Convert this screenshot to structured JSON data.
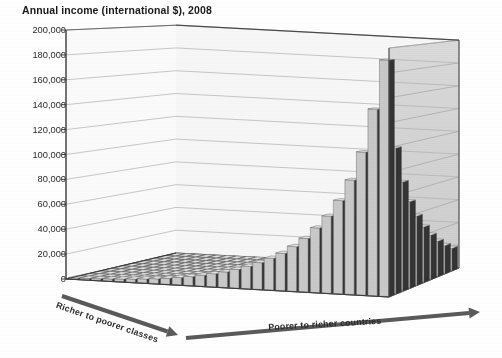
{
  "chart_data": {
    "type": "bar",
    "title": "Annual income (international $), 2008",
    "subtitle": "",
    "xlabel": "Poorer to richer countries",
    "ylabel": "Richer to poorer classes",
    "zlabel": "Annual income (international $)",
    "projection": "3d-surface-bars",
    "grid": true,
    "legend_position": "none",
    "zlim": [
      0,
      200000
    ],
    "ztick_labels": [
      "200,000",
      "180,000",
      "160,000",
      "140,000",
      "120,000",
      "100,000",
      "80,000",
      "60,000",
      "40,000",
      "20,000",
      "0"
    ],
    "ztick_values": [
      200000,
      180000,
      160000,
      140000,
      120000,
      100000,
      80000,
      60000,
      40000,
      20000,
      0
    ],
    "ztick_interval": 20000,
    "annotations": [
      {
        "text": "Richer to poorer classes",
        "kind": "axis-arrow",
        "direction": "right-down"
      },
      {
        "text": "Poorer to richer countries",
        "kind": "axis-arrow",
        "direction": "right"
      }
    ],
    "row_axis": "income class (decile), richer to poorer",
    "col_axis": "country, poorer to richer",
    "categories_rows": [
      "class 1 (richest)",
      "class 2",
      "class 3",
      "class 4",
      "class 5",
      "class 6",
      "class 7",
      "class 8",
      "class 9",
      "class 10 (poorest)"
    ],
    "categories_cols": [
      "c01",
      "c02",
      "c03",
      "c04",
      "c05",
      "c06",
      "c07",
      "c08",
      "c09",
      "c10",
      "c11",
      "c12",
      "c13",
      "c14",
      "c15",
      "c16",
      "c17",
      "c18",
      "c19",
      "c20",
      "c21",
      "c22",
      "c23",
      "c24",
      "c25",
      "c26",
      "c27",
      "c28"
    ],
    "series": [
      {
        "name": "class 1 (richest)",
        "values": [
          900,
          1100,
          1400,
          1700,
          2100,
          2600,
          3200,
          3900,
          4800,
          5900,
          7200,
          8800,
          10500,
          12500,
          15000,
          18000,
          21500,
          25500,
          30000,
          36000,
          43000,
          52000,
          62000,
          75000,
          92000,
          115000,
          150000,
          190000
        ]
      },
      {
        "name": "class 2",
        "values": [
          600,
          740,
          930,
          1150,
          1400,
          1750,
          2150,
          2600,
          3200,
          3950,
          4800,
          5900,
          7000,
          8400,
          10000,
          12000,
          14300,
          17000,
          20000,
          24000,
          28500,
          34500,
          41000,
          49500,
          60000,
          75000,
          95000,
          118000
        ]
      },
      {
        "name": "class 3",
        "values": [
          450,
          560,
          700,
          860,
          1060,
          1320,
          1620,
          1960,
          2420,
          2980,
          3620,
          4450,
          5280,
          6330,
          7540,
          9050,
          10780,
          12800,
          15080,
          18100,
          21500,
          26000,
          30900,
          37300,
          45200,
          56500,
          71600,
          88900
        ]
      },
      {
        "name": "class 4",
        "values": [
          360,
          445,
          560,
          690,
          850,
          1050,
          1300,
          1570,
          1940,
          2390,
          2900,
          3560,
          4230,
          5070,
          6030,
          7240,
          8620,
          10250,
          12060,
          14480,
          17200,
          20800,
          24700,
          29850,
          36150,
          45200,
          57300,
          71100
        ]
      },
      {
        "name": "class 5",
        "values": [
          290,
          360,
          450,
          555,
          685,
          850,
          1045,
          1265,
          1560,
          1925,
          2335,
          2870,
          3410,
          4080,
          4860,
          5830,
          6940,
          8250,
          9710,
          11660,
          13850,
          16750,
          19900,
          24050,
          29100,
          36400,
          46100,
          57300
        ]
      },
      {
        "name": "class 6",
        "values": [
          235,
          290,
          363,
          448,
          553,
          685,
          843,
          1020,
          1258,
          1553,
          1883,
          2315,
          2750,
          3290,
          3920,
          4700,
          5600,
          6650,
          7830,
          9400,
          11170,
          13500,
          16050,
          19400,
          23450,
          29350,
          37200,
          46200
        ]
      },
      {
        "name": "class 7",
        "values": [
          190,
          234,
          293,
          362,
          446,
          553,
          680,
          823,
          1015,
          1253,
          1519,
          1868,
          2219,
          2655,
          3163,
          3793,
          4518,
          5366,
          6318,
          7584,
          9013,
          10893,
          12950,
          15654,
          18920,
          23680,
          30010,
          37270
        ]
      },
      {
        "name": "class 8",
        "values": [
          152,
          188,
          235,
          290,
          358,
          444,
          546,
          661,
          815,
          1006,
          1220,
          1500,
          1782,
          2131,
          2539,
          3045,
          3627,
          4308,
          5072,
          6089,
          7236,
          8745,
          10397,
          12568,
          15190,
          19011,
          24093,
          29922
        ]
      },
      {
        "name": "class 9",
        "values": [
          121,
          150,
          188,
          232,
          287,
          355,
          437,
          529,
          652,
          805,
          976,
          1200,
          1426,
          1705,
          2031,
          2436,
          2902,
          3446,
          4058,
          4871,
          5789,
          6996,
          8318,
          10054,
          12152,
          15209,
          19274,
          23937
        ]
      },
      {
        "name": "class 10 (poorest)",
        "values": [
          97,
          120,
          150,
          186,
          229,
          284,
          350,
          423,
          522,
          644,
          781,
          960,
          1141,
          1364,
          1625,
          1949,
          2321,
          2757,
          3246,
          3897,
          4631,
          5597,
          6654,
          8043,
          9722,
          12167,
          15419,
          19150
        ]
      }
    ],
    "peak": {
      "label": "richest class in richest country",
      "value": 190000
    },
    "colors": {
      "wall_back": "#f7f7f7",
      "wall_right": "#d4d4d4",
      "floor": "#6d6d6d",
      "gridline": "#b0b0b0",
      "bar_face": "#c9c9c9",
      "bar_side": "#343434",
      "bar_top": "#e3e3e3",
      "axis": "#3a3a3a",
      "arrow": "#5a5a5a",
      "text": "#1a1a1a",
      "background": "#ffffff"
    }
  },
  "figure": {
    "title": "Annual income (international $), 2008",
    "axis_labels": {
      "depth": "Richer to poorer classes",
      "horizontal": "Poorer to richer countries"
    },
    "yticks": [
      "200,000",
      "180,000",
      "160,000",
      "140,000",
      "120,000",
      "100,000",
      "80,000",
      "60,000",
      "40,000",
      "20,000",
      "0"
    ]
  }
}
